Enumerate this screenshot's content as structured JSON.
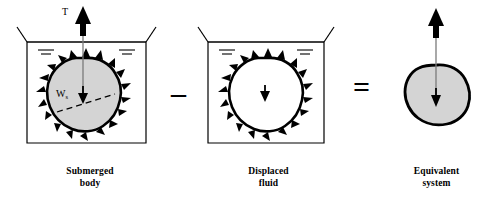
{
  "figure": {
    "background_color": "#ffffff",
    "body_fill_color": "#d4d4d4",
    "body_outline_color": "#000000",
    "tank_line_color": "#000000",
    "arrow_color": "#000000"
  },
  "operators": {
    "minus": "–",
    "equals": "="
  },
  "panels": {
    "submerged": {
      "caption_line1": "Submerged",
      "caption_line2": "body",
      "tension_label": "T",
      "weight_label": "W",
      "weight_subscript": "s",
      "has_tank": true,
      "has_pressure_arrows": true,
      "has_dashed_line": true,
      "water_level_marks": 2
    },
    "displaced": {
      "caption_line1": "Displaced",
      "caption_line2": "fluid",
      "tension_label": "",
      "weight_label": "W",
      "weight_subscript": "f",
      "has_tank": true,
      "has_pressure_arrows": true,
      "has_dashed_line": false,
      "water_level_marks": 2
    },
    "equivalent": {
      "caption_line1": "Equivalent",
      "caption_line2": "system",
      "tension_label": "T",
      "weight_label": "W",
      "weight_subscript": "s",
      "has_tank": false,
      "has_pressure_arrows": false,
      "has_dashed_line": false,
      "water_level_marks": 0
    }
  }
}
